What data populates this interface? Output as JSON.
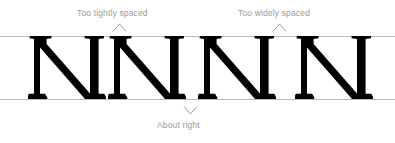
{
  "figure": {
    "type": "typography-spacing-illustration",
    "glyph": "N",
    "glyph_style": "roman-serif-capital",
    "ink_color": "#000000",
    "guide_color": "#b9b9b9",
    "annotation_color": "#9b9b9b",
    "background": "#ffffff"
  },
  "guides": {
    "top_label": "cap-height-line",
    "baseline_label": "baseline"
  },
  "letters": [
    {
      "char": "N",
      "index": 1
    },
    {
      "char": "N",
      "index": 2
    },
    {
      "char": "N",
      "index": 3
    },
    {
      "char": "N",
      "index": 4
    }
  ],
  "annotations": [
    {
      "id": "too-tightly-spaced",
      "text": "Too tightly spaced",
      "marker": "chevron-up",
      "points_to": "gap-between-letter-1-and-2"
    },
    {
      "id": "too-widely-spaced",
      "text": "Too widely spaced",
      "marker": "chevron-up",
      "points_to": "gap-between-letter-3-and-4"
    },
    {
      "id": "about-right",
      "text": "About right",
      "marker": "chevron-down",
      "points_to": "gap-between-letter-2-and-3"
    }
  ]
}
